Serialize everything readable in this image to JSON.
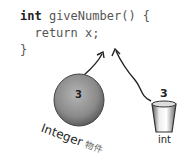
{
  "code": {
    "line1_keyword": "int",
    "line1_rest": " giveNumber() {",
    "line2": "  return x;",
    "line3": "}"
  },
  "integer_object": {
    "value": "3",
    "label": "Integer",
    "label_cn": "物件",
    "fill_color": "#8a8a8a"
  },
  "int_primitive": {
    "value": "3",
    "label": "int"
  }
}
